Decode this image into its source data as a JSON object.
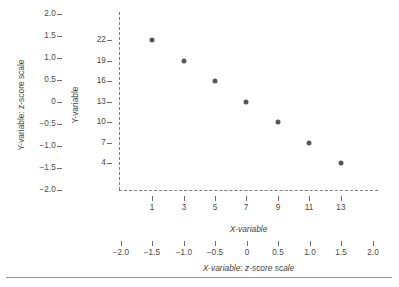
{
  "chart_data": {
    "type": "scatter",
    "title": "",
    "xlabel": "X-variable",
    "ylabel": "Y-variable",
    "secondary_xlabel": "X-variable: z-score scale",
    "secondary_ylabel": "Y-variable: z-score scale",
    "x": [
      1,
      3,
      5,
      7,
      9,
      11,
      13
    ],
    "y": [
      22,
      19,
      16,
      13,
      10,
      7,
      4
    ],
    "x_zscores": [
      -1.5,
      -1.0,
      -0.5,
      0,
      0.5,
      1.0,
      1.5
    ],
    "y_zscores": [
      1.5,
      1.0,
      0.5,
      0,
      -0.5,
      -1.0,
      -1.5
    ],
    "xlim": [
      0,
      14
    ],
    "ylim": [
      2.5,
      23.5
    ],
    "xlim_z": [
      -2.0,
      2.0
    ],
    "ylim_z": [
      -2.0,
      2.0
    ],
    "grid": false,
    "legend": null,
    "marker_color": "#585858",
    "axis_style": "dashed",
    "x_ticks": [
      "1",
      "3",
      "5",
      "7",
      "9",
      "11",
      "13"
    ],
    "y_ticks": [
      "22",
      "19",
      "16",
      "13",
      "10",
      "7",
      "4"
    ],
    "x_z_ticks": [
      "−2.0",
      "−1.5",
      "−1.0",
      "−0.5",
      "0",
      "0.5",
      "1.0",
      "1.5",
      "2.0"
    ],
    "y_z_ticks": [
      "2.0",
      "1.5",
      "1.0",
      "0.5",
      "0",
      "−0.5",
      "−1.0",
      "−1.5",
      "−2.0"
    ]
  },
  "axes": {
    "y_zscore": {
      "title": "Y-variable: z-score scale",
      "ticks": [
        {
          "label": "2.0",
          "py": 14
        },
        {
          "label": "1.5",
          "py": 36
        },
        {
          "label": "1.0",
          "py": 58
        },
        {
          "label": "0.5",
          "py": 80
        },
        {
          "label": "0",
          "py": 102
        },
        {
          "label": "−0.5",
          "py": 124
        },
        {
          "label": "−1.0",
          "py": 146
        },
        {
          "label": "−1.5",
          "py": 168
        },
        {
          "label": "−2.0",
          "py": 190
        }
      ]
    },
    "y_variable": {
      "title": "Y-variable",
      "ticks": [
        {
          "label": "22",
          "py": 40
        },
        {
          "label": "19",
          "py": 61
        },
        {
          "label": "16",
          "py": 81
        },
        {
          "label": "13",
          "py": 102
        },
        {
          "label": "10",
          "py": 122
        },
        {
          "label": "7",
          "py": 143
        },
        {
          "label": "4",
          "py": 163
        }
      ]
    },
    "x_variable": {
      "title": "X-variable",
      "ticks": [
        {
          "label": "1",
          "px": 152
        },
        {
          "label": "3",
          "px": 184
        },
        {
          "label": "5",
          "px": 215
        },
        {
          "label": "7",
          "px": 246
        },
        {
          "label": "9",
          "px": 278
        },
        {
          "label": "11",
          "px": 309
        },
        {
          "label": "13",
          "px": 341
        }
      ]
    },
    "x_zscore": {
      "title": "X-variable: z-score scale",
      "ticks": [
        {
          "label": "−2.0",
          "px": 121
        },
        {
          "label": "−1.5",
          "px": 152
        },
        {
          "label": "−1.0",
          "px": 184
        },
        {
          "label": "−0.5",
          "px": 215
        },
        {
          "label": "0",
          "px": 247
        },
        {
          "label": "0.5",
          "px": 278
        },
        {
          "label": "1.0",
          "px": 310
        },
        {
          "label": "1.5",
          "px": 341
        },
        {
          "label": "2.0",
          "px": 373
        }
      ]
    }
  },
  "points": [
    {
      "px": 152,
      "py": 40,
      "x": 1,
      "y": 22
    },
    {
      "px": 184,
      "py": 61,
      "x": 3,
      "y": 19
    },
    {
      "px": 215,
      "py": 81,
      "x": 5,
      "y": 16
    },
    {
      "px": 246,
      "py": 102,
      "x": 7,
      "y": 13
    },
    {
      "px": 278,
      "py": 122,
      "x": 9,
      "y": 10
    },
    {
      "px": 309,
      "py": 143,
      "x": 11,
      "y": 7
    },
    {
      "px": 341,
      "py": 163,
      "x": 13,
      "y": 4
    }
  ]
}
